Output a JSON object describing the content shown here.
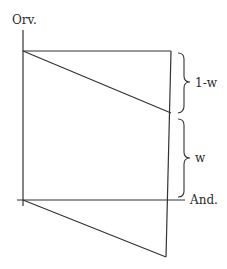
{
  "diagram": {
    "axis_labels": {
      "vertical": "Orv.",
      "horizontal": "And."
    },
    "brace_labels": {
      "upper": "1-w",
      "lower": "w"
    },
    "colors": {
      "stroke": "#333333",
      "text": "#2a2a2a",
      "background": "#ffffff"
    }
  }
}
